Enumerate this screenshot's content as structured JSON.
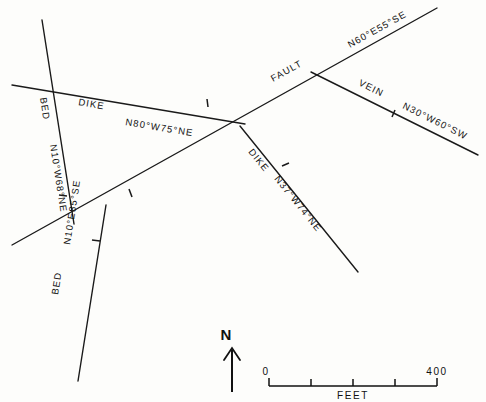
{
  "figure": {
    "kind": "geologic-structure-map",
    "background_color": "#fdfdfb",
    "line_color": "#1a1a1a"
  },
  "structures": [
    {
      "id": "dike-upper",
      "type_label": "DIKE",
      "attitude_label": "N80°W75°NE",
      "strike": "N80°W",
      "dip": "75°NE",
      "x1": 12,
      "y1": 85,
      "x2": 245,
      "y2": 124
    },
    {
      "id": "bed-upper",
      "type_label": "BED",
      "attitude_label": "N10°W68°NE",
      "strike": "N10°W",
      "dip": "68°NE",
      "x1": 42,
      "y1": 20,
      "x2": 74,
      "y2": 224
    },
    {
      "id": "bed-lower",
      "type_label": "BED",
      "attitude_label": "N10°E85°SE",
      "strike": "N10°E",
      "dip": "85°SE",
      "x1": 106,
      "y1": 205,
      "x2": 78,
      "y2": 381
    },
    {
      "id": "fault",
      "type_label": "FAULT",
      "attitude_label": "N60°E55°SE",
      "strike": "N60°E",
      "dip": "55°SE",
      "x1": 12,
      "y1": 245,
      "x2": 437,
      "y2": 8
    },
    {
      "id": "vein",
      "type_label": "VEIN",
      "attitude_label": "N30°W60°SW",
      "strike": "N30°W",
      "dip": "60°SW",
      "x1": 311,
      "y1": 72,
      "x2": 478,
      "y2": 155
    },
    {
      "id": "dike-lower",
      "type_label": "DIKE",
      "attitude_label": "N37°W74°NE",
      "strike": "N37°W",
      "dip": "74°NE",
      "x1": 240,
      "y1": 126,
      "x2": 358,
      "y2": 272
    }
  ],
  "labels": {
    "dike_upper_type": "DIKE",
    "dike_upper_attitude": "N80°W75°NE",
    "bed_upper_type": "BED",
    "bed_upper_attitude": "N10°W68°NE",
    "bed_lower_type": "BED",
    "bed_lower_attitude": "N10°E85°SE",
    "fault_type": "FAULT",
    "fault_attitude": "N60°E55°SE",
    "vein_type": "VEIN",
    "vein_attitude": "N30°W60°SW",
    "dike_lower_type": "DIKE",
    "dike_lower_attitude": "N37°W74°NE"
  },
  "north_arrow": {
    "letter": "N"
  },
  "scale_bar": {
    "start_label": "0",
    "end_label": "400",
    "units_label": "FEET",
    "divisions": 4
  }
}
